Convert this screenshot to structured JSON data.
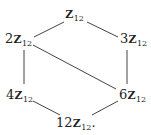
{
  "diagram": {
    "type": "hasse-diagram",
    "nodes": [
      {
        "id": "n1",
        "coef": "",
        "ring": "Z",
        "sub": "12",
        "suffix": ""
      },
      {
        "id": "n2",
        "coef": "2",
        "ring": "Z",
        "sub": "12",
        "suffix": ""
      },
      {
        "id": "n3",
        "coef": "3",
        "ring": "Z",
        "sub": "12",
        "suffix": ""
      },
      {
        "id": "n4",
        "coef": "4",
        "ring": "Z",
        "sub": "12",
        "suffix": ""
      },
      {
        "id": "n6",
        "coef": "6",
        "ring": "Z",
        "sub": "12",
        "suffix": ""
      },
      {
        "id": "n12",
        "coef": "12",
        "ring": "Z",
        "sub": "12",
        "suffix": "."
      }
    ],
    "edges": [
      {
        "from": "Z12",
        "to": "2Z12",
        "x1": 64,
        "y1": 22,
        "x2": 34,
        "y2": 37
      },
      {
        "from": "Z12",
        "to": "3Z12",
        "x1": 87,
        "y1": 22,
        "x2": 118,
        "y2": 37
      },
      {
        "from": "2Z12",
        "to": "4Z12",
        "x1": 24,
        "y1": 50,
        "x2": 24,
        "y2": 84
      },
      {
        "from": "3Z12",
        "to": "6Z12",
        "x1": 127,
        "y1": 50,
        "x2": 127,
        "y2": 84
      },
      {
        "from": "2Z12",
        "to": "6Z12",
        "x1": 33,
        "y1": 45,
        "x2": 116,
        "y2": 89
      },
      {
        "from": "4Z12",
        "to": "12Z12",
        "x1": 33,
        "y1": 101,
        "x2": 60,
        "y2": 115
      },
      {
        "from": "6Z12",
        "to": "12Z12",
        "x1": 118,
        "y1": 101,
        "x2": 92,
        "y2": 115
      }
    ],
    "line_color": "#444444"
  }
}
